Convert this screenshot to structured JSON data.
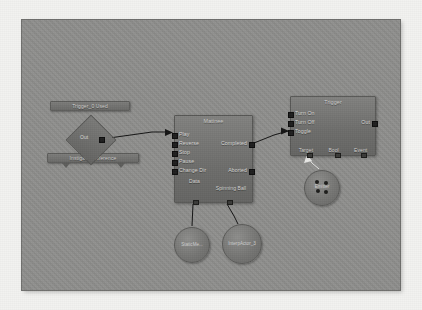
{
  "app": {
    "editor": "blueprint-node-graph",
    "canvas_color": "#8e8e8c",
    "frame_color": "#f2f2f0",
    "wire_color": "#141414",
    "wire_highlight_color": "#e8e8e6",
    "node_color": "#6d6d6b",
    "pin_color": "#1e1e1e",
    "text_color": "#d6d6d4"
  },
  "nodes": {
    "trigger_used": {
      "title": "Trigger_0 Used",
      "kind": "event-bar"
    },
    "event_diamond": {
      "out_label": "Out",
      "kind": "event-diamond"
    },
    "instigator": {
      "title": "Instigator   Difference",
      "kind": "variable-bar"
    },
    "matinee": {
      "title": "Matinee",
      "kind": "action-node",
      "inputs": [
        "Play",
        "Reverse",
        "Stop",
        "Pause",
        "Change Dir"
      ],
      "outputs": [
        "Completed",
        "Aborted"
      ],
      "bottom": [
        "Data",
        "Spinning Ball"
      ]
    },
    "trigger": {
      "title": "Trigger",
      "kind": "action-node",
      "inputs": [
        "Turn On",
        "Turn Off",
        "Toggle"
      ],
      "outputs": [
        "Out"
      ],
      "bottom": [
        "Target",
        "Bool",
        "Event"
      ]
    },
    "emitter": {
      "label": "Emitter",
      "kind": "object-circle",
      "dot_count": 4
    },
    "static_mesh": {
      "label": "StaticMe...",
      "kind": "object-circle"
    },
    "interp_actor": {
      "label": "InterpActor_3",
      "kind": "object-circle"
    }
  },
  "connections": [
    {
      "from": "event_diamond.Out",
      "to": "matinee.Play"
    },
    {
      "from": "matinee.Completed",
      "to": "trigger.Toggle"
    },
    {
      "from": "matinee.Data",
      "to": "static_mesh"
    },
    {
      "from": "matinee.Spinning Ball",
      "to": "interp_actor"
    },
    {
      "from": "emitter",
      "to": "trigger.Target"
    }
  ]
}
